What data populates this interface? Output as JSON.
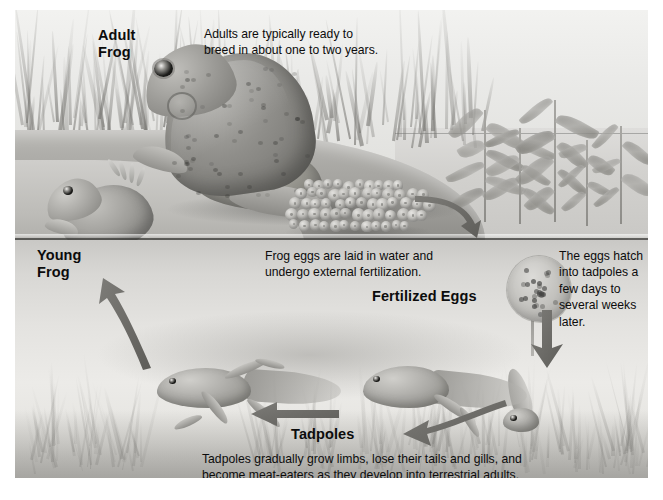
{
  "figure": {
    "palette": {
      "ink": "#0c0c0c",
      "sky": "#eeeeec",
      "bank": "#a9a8a4",
      "water": "#e4e3e0",
      "waterline": "#3c3c3a",
      "arrow": "#6e6d69",
      "page": "#ffffff"
    }
  },
  "labels": {
    "adult_frog": "Adult\nFrog",
    "adult_frog_line1": "Adult",
    "adult_frog_line2": "Frog",
    "young_frog_line1": "Young",
    "young_frog_line2": "Frog",
    "fertilized_eggs": "Fertilized Eggs",
    "tadpoles": "Tadpoles"
  },
  "captions": {
    "adults": "Adults are typically ready to breed in about one to two years.",
    "adults_line1": "Adults are typically ready to",
    "adults_line2": "breed in about one to two years.",
    "eggs": "Frog eggs are laid in water and undergo external fertilization.",
    "eggs_line1": "Frog eggs are laid in water and",
    "eggs_line2": "undergo external fertilization.",
    "hatch": "The eggs hatch into tadpoles a few days to several weeks later.",
    "hatch_line1": "The eggs hatch",
    "hatch_line2": "into tadpoles a",
    "hatch_line3": "few days to",
    "hatch_line4": "several weeks",
    "hatch_line5": "later.",
    "tadpoles": "Tadpoles gradually grow limbs, lose their tails and gills, and become meat-eaters as they develop into terrestrial adults.",
    "tadpoles_line1": "Tadpoles gradually grow limbs, lose their tails and gills, and",
    "tadpoles_line2": "become meat-eaters as they develop into terrestrial adults."
  },
  "scene": {
    "adult_frog_alt": "large adult frog sitting on bank",
    "young_frog_alt": "young frog climbing out of water at left",
    "egg_mass_alt": "cluster of frog eggs on bank edge",
    "fertilized_eggs_alt": "round speckled fertilized egg clump underwater",
    "tadpole_hatchling_alt": "newly hatched tadpole",
    "tadpole_mid_alt": "tadpole with hind legs and tail",
    "tadpole_late_alt": "tadpole with four legs and shrinking tail",
    "aquatic_plants_alt": "emergent aquatic plants at waterline",
    "grass_alt": "grass blades along the bank"
  },
  "arrows": [
    {
      "name": "eggs-to-water",
      "direction": "down-right"
    },
    {
      "name": "eggs-to-hatchling",
      "direction": "down"
    },
    {
      "name": "hatchling-to-tadpole",
      "direction": "left"
    },
    {
      "name": "tadpole-to-froglet",
      "direction": "left"
    },
    {
      "name": "froglet-to-young-frog",
      "direction": "up-left"
    }
  ]
}
